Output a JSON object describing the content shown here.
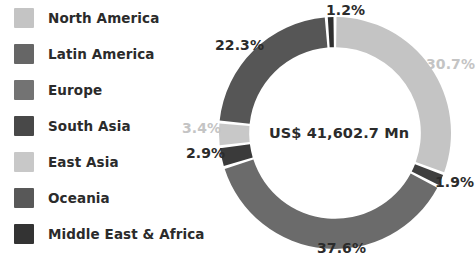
{
  "legend": {
    "items": [
      {
        "label": "North America",
        "color": "#c4c4c4"
      },
      {
        "label": "Latin America",
        "color": "#666666"
      },
      {
        "label": "Europe",
        "color": "#737373"
      },
      {
        "label": "South Asia",
        "color": "#484848"
      },
      {
        "label": "East Asia",
        "color": "#c8c8c8"
      },
      {
        "label": "Oceania",
        "color": "#585858"
      },
      {
        "label": "Middle East & Africa",
        "color": "#333333"
      }
    ]
  },
  "center": {
    "value_label": "US$ 41,602.7 Mn"
  },
  "labels": {
    "north_america": "30.7%",
    "south_asia": "1.9%",
    "latin_america": "37.6%",
    "middle_east_africa_left": "2.9%",
    "east_asia": "3.4%",
    "oceania": "22.3%",
    "middle_east_africa_top": "1.2%"
  },
  "chart_data": {
    "type": "pie",
    "title": "",
    "subtitle": "",
    "center_text": "US$ 41,602.7 Mn",
    "donut": true,
    "inner_radius_ratio": 0.74,
    "start_angle_deg": -90,
    "direction": "clockwise",
    "legend_position": "left",
    "grid": false,
    "units": "percent",
    "total_value": "US$ 41,602.7 Mn",
    "categories": [
      "North America",
      "South Asia",
      "Latin America",
      "Middle East & Africa",
      "East Asia",
      "Oceania",
      "Middle East & Africa"
    ],
    "slices": [
      {
        "name": "North America",
        "value": 30.7,
        "label": "30.7%",
        "color": "#c4c4c4",
        "label_color": "#c4c4c4"
      },
      {
        "name": "South Asia",
        "value": 1.9,
        "label": "1.9%",
        "color": "#3f3f3f",
        "label_color": "#2b2b2b"
      },
      {
        "name": "Latin America",
        "value": 37.6,
        "label": "37.6%",
        "color": "#6b6b6b",
        "label_color": "#2b2b2b"
      },
      {
        "name": "Middle East & Africa",
        "value": 2.9,
        "label": "2.9%",
        "color": "#3a3a3a",
        "label_color": "#2b2b2b"
      },
      {
        "name": "East Asia",
        "value": 3.4,
        "label": "3.4%",
        "color": "#c8c8c8",
        "label_color": "#c4c4c4"
      },
      {
        "name": "Oceania",
        "value": 22.3,
        "label": "22.3%",
        "color": "#565656",
        "label_color": "#2b2b2b"
      },
      {
        "name": "Middle East & Africa",
        "value": 1.2,
        "label": "1.2%",
        "color": "#2f2f2f",
        "label_color": "#2b2b2b"
      }
    ],
    "values": [
      30.7,
      1.9,
      37.6,
      2.9,
      3.4,
      22.3,
      1.2
    ]
  }
}
